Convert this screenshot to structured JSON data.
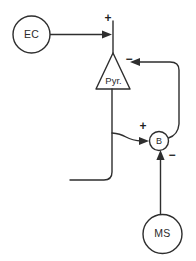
{
  "diagram": {
    "background_color": "#ffffff",
    "stroke_color": "#2e2e2e",
    "text_color": "#2b2b2b",
    "width": 196,
    "height": 261,
    "nodes": [
      {
        "id": "ec",
        "label": "EC",
        "shape": "circle",
        "cx": 31.5,
        "cy": 34.5,
        "r": 18.5
      },
      {
        "id": "pyr",
        "label": "Pyr.",
        "shape": "triangle",
        "apex_x": 113,
        "apex_y": 53,
        "base_left_x": 96,
        "base_right_x": 130,
        "base_y": 89
      },
      {
        "id": "b",
        "label": "B",
        "shape": "circle",
        "cx": 159,
        "cy": 141,
        "r": 9.5
      },
      {
        "id": "ms",
        "label": "MS",
        "shape": "circle",
        "cx": 162.5,
        "cy": 234,
        "r": 19.5
      }
    ],
    "signs": [
      {
        "id": "sign-ec-pyr",
        "text": "+",
        "x": 108,
        "y": 19
      },
      {
        "id": "sign-b-pyr",
        "text": "−",
        "x": 129,
        "y": 60
      },
      {
        "id": "sign-pyr-b",
        "text": "+",
        "x": 143,
        "y": 127
      },
      {
        "id": "sign-ms-b",
        "text": "−",
        "x": 172,
        "y": 156
      }
    ],
    "connections": [
      {
        "id": "ec-to-pyr",
        "from": "ec",
        "to": "pyr",
        "sign": "+",
        "description": "Entorhinal cortex excitatory input to pyramidal cell apical dendrite"
      },
      {
        "id": "pyr-to-b",
        "from": "pyr",
        "to": "b",
        "sign": "+",
        "description": "Pyramidal cell excitatory collateral to basket cell"
      },
      {
        "id": "b-to-pyr",
        "from": "b",
        "to": "pyr",
        "sign": "−",
        "description": "Basket cell inhibitory feedback to pyramidal cell"
      },
      {
        "id": "ms-to-b",
        "from": "ms",
        "to": "b",
        "sign": "−",
        "description": "Medial septum inhibitory input to basket cell"
      },
      {
        "id": "pyr-output",
        "from": "pyr",
        "to": "output",
        "sign": "",
        "description": "Pyramidal cell axonal output exiting to the left"
      }
    ]
  }
}
